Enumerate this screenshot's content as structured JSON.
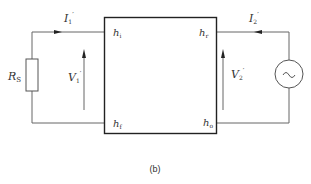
{
  "diagram": {
    "type": "two-port h-parameter equivalent circuit",
    "caption": "(b)",
    "colors": {
      "line": "#555555",
      "box": "#222222",
      "text": "#333333"
    },
    "labels": {
      "source_resistor": "R",
      "source_resistor_sub": "S",
      "input_current": "I",
      "input_current_sub": "1",
      "input_current_prime": "′",
      "output_current": "I",
      "output_current_sub": "2",
      "output_current_prime": "′",
      "input_voltage": "V",
      "input_voltage_sub": "1",
      "input_voltage_prime": "′",
      "output_voltage": "V",
      "output_voltage_sub": "2",
      "output_voltage_prime": "′",
      "h_top_left": "h",
      "h_top_left_sub": "i",
      "h_top_right": "h",
      "h_top_right_sub": "r",
      "h_bottom_left": "h",
      "h_bottom_left_sub": "f",
      "h_bottom_right": "h",
      "h_bottom_right_sub": "o",
      "ac_source_symbol": "~"
    },
    "components": [
      "source-resistor",
      "two-port-box",
      "ac-voltage-source"
    ],
    "arrows": {
      "input_current_direction": "right",
      "output_current_direction": "left",
      "input_voltage_direction": "up",
      "output_voltage_direction": "up"
    }
  }
}
